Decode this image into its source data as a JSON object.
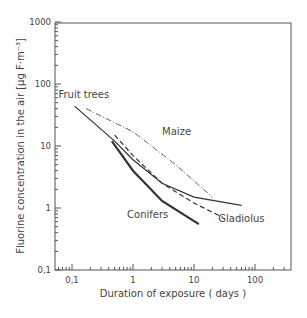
{
  "chart_data": {
    "type": "line",
    "title": "",
    "xlabel": "Duration of exposure ( days )",
    "ylabel": "Fluorine concentration in the air [µg F·m⁻³]",
    "xscale": "log",
    "yscale": "log",
    "xlim": [
      0.05,
      300
    ],
    "ylim": [
      0.1,
      1000
    ],
    "x_ticks": [
      "0,1",
      "1",
      "10",
      "100"
    ],
    "y_ticks": [
      "0,1",
      "1",
      "10",
      "100",
      "1000"
    ],
    "grid": false,
    "legend": "inline labels",
    "series": [
      {
        "name": "Fruit trees",
        "style": "solid-thin",
        "points": [
          [
            0.11,
            44
          ],
          [
            0.5,
            12
          ],
          [
            1,
            6
          ],
          [
            3,
            2.5
          ],
          [
            10,
            1.5
          ],
          [
            60,
            1.1
          ]
        ]
      },
      {
        "name": "Maize",
        "style": "dash-dot",
        "points": [
          [
            0.17,
            40
          ],
          [
            1,
            17
          ],
          [
            5,
            5
          ],
          [
            20,
            1.5
          ]
        ]
      },
      {
        "name": "Gladiolus",
        "style": "dashed",
        "points": [
          [
            0.5,
            15
          ],
          [
            1,
            7
          ],
          [
            3,
            2.5
          ],
          [
            10,
            1.2
          ],
          [
            30,
            0.7
          ]
        ]
      },
      {
        "name": "Conifers",
        "style": "solid-thick",
        "points": [
          [
            0.45,
            12
          ],
          [
            1,
            4
          ],
          [
            3,
            1.3
          ],
          [
            12,
            0.55
          ]
        ]
      }
    ],
    "annotations": [
      {
        "text": "Fruit trees",
        "x": 0.06,
        "y": 60
      },
      {
        "text": "Maize",
        "x": 3,
        "y": 15
      },
      {
        "text": "Conifers",
        "x": 0.8,
        "y": 0.7
      },
      {
        "text": "Gladiolus",
        "x": 25,
        "y": 0.6
      }
    ]
  }
}
